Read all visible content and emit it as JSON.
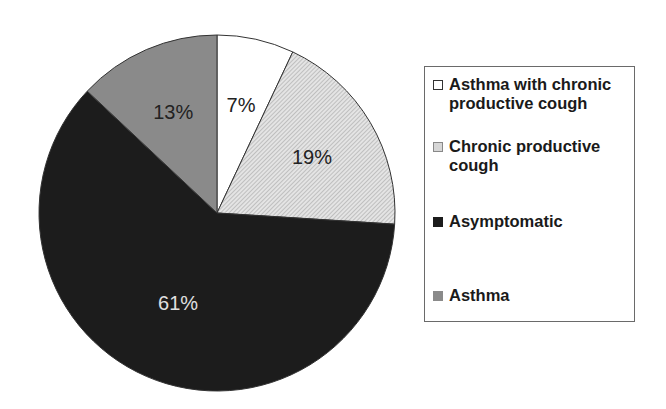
{
  "chart_data": {
    "type": "pie",
    "title": "",
    "categories": [
      "Asthma with chronic productive cough",
      "Chronic productive cough",
      "Asymptomatic",
      "Asthma"
    ],
    "values": [
      7,
      19,
      61,
      13
    ],
    "unit": "%",
    "labels": [
      "7%",
      "19%",
      "61%",
      "13%"
    ],
    "colors": [
      "#ffffff",
      "#d6d6d6",
      "#1c1c1c",
      "#8a8a8a"
    ],
    "start_angle": "12 o'clock, clockwise",
    "legend_position": "right"
  },
  "legend": {
    "items": [
      {
        "label": "Asthma with chronic productive cough"
      },
      {
        "label": "Chronic productive cough"
      },
      {
        "label": "Asymptomatic"
      },
      {
        "label": "Asthma"
      }
    ]
  },
  "slice_labels": [
    "7%",
    "19%",
    "61%",
    "13%"
  ]
}
